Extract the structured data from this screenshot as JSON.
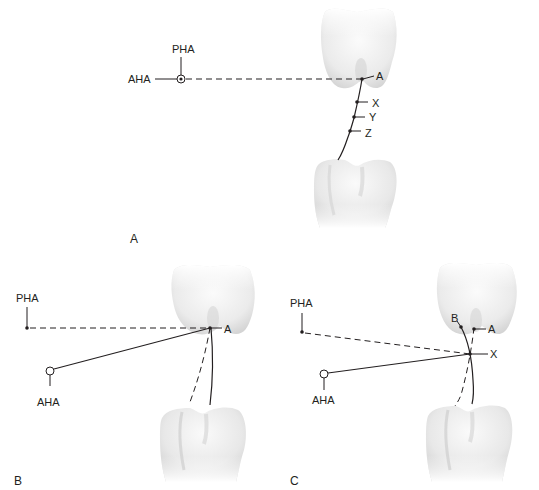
{
  "figure": {
    "panels": [
      {
        "id": "A",
        "label": "A",
        "points": {
          "pha": "PHA",
          "aha": "AHA",
          "a": "A",
          "x": "X",
          "y": "Y",
          "z": "Z"
        }
      },
      {
        "id": "B",
        "label": "B",
        "points": {
          "pha": "PHA",
          "aha": "AHA",
          "a": "A"
        }
      },
      {
        "id": "C",
        "label": "C",
        "points": {
          "pha": "PHA",
          "aha": "AHA",
          "a": "A",
          "b": "B",
          "x": "X"
        }
      }
    ],
    "colors": {
      "line": "#231f20",
      "tooth_light": "#f4f4f4",
      "tooth_shade": "#d9d9d9"
    }
  }
}
